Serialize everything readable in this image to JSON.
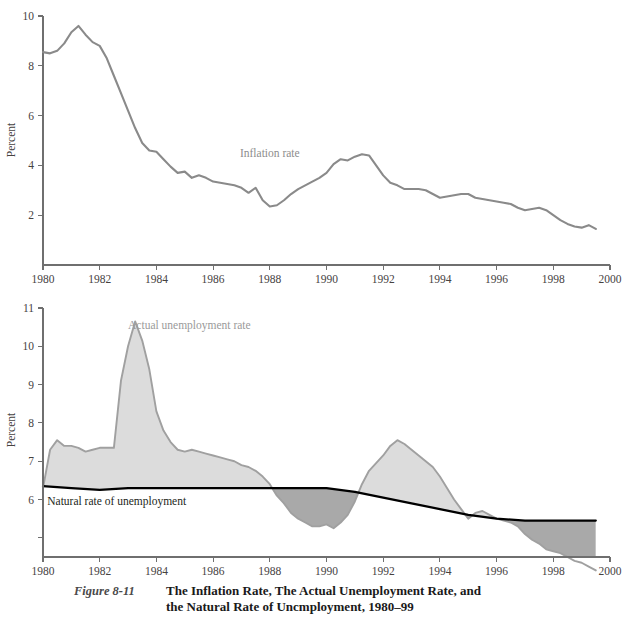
{
  "figure": {
    "number_label": "Figure 8-11",
    "title_line1": "The Inflation Rate, The Actual Unemployment Rate, and",
    "title_line2": "the Natural Rate of Uncmployment, 1980–99"
  },
  "colors": {
    "inflation_line": "#8a8a8a",
    "actual_line": "#a0a0a0",
    "natural_line": "#000000",
    "fill_above_natural": "#dcdcdc",
    "fill_below_natural": "#a9a9a9",
    "axis": "#6f6f6f",
    "tick_text": "#46423f"
  },
  "chart_data": [
    {
      "type": "line",
      "id": "inflation-chart",
      "title": "",
      "xlabel": "",
      "ylabel": "Percent",
      "xlim": [
        1980,
        2000
      ],
      "ylim": [
        0,
        10
      ],
      "xticks": [
        1980,
        1982,
        1984,
        1986,
        1988,
        1990,
        1992,
        1994,
        1996,
        1998,
        2000
      ],
      "xtick_labels": [
        "1980",
        "1982",
        "1984",
        "1986",
        "1988",
        "1990",
        "1992",
        "1994",
        "1996",
        "1998",
        "2000"
      ],
      "yticks": [
        2,
        4,
        6,
        8,
        10
      ],
      "ytick_labels": [
        "2",
        "4",
        "6",
        "8",
        "10"
      ],
      "grid": false,
      "legend_position": "inline-annotation",
      "annotations": [
        {
          "text": "Inflation rate",
          "x": 1988.0,
          "y": 4.35
        }
      ],
      "series": [
        {
          "name": "Inflation rate",
          "color": "#8a8a8a",
          "x": [
            1980.0,
            1980.25,
            1980.5,
            1980.75,
            1981.0,
            1981.25,
            1981.5,
            1981.75,
            1982.0,
            1982.25,
            1982.5,
            1982.75,
            1983.0,
            1983.25,
            1983.5,
            1983.75,
            1984.0,
            1984.25,
            1984.5,
            1984.75,
            1985.0,
            1985.25,
            1985.5,
            1985.75,
            1986.0,
            1986.25,
            1986.5,
            1986.75,
            1987.0,
            1987.25,
            1987.5,
            1987.75,
            1988.0,
            1988.25,
            1988.5,
            1988.75,
            1989.0,
            1989.25,
            1989.5,
            1989.75,
            1990.0,
            1990.25,
            1990.5,
            1990.75,
            1991.0,
            1991.25,
            1991.5,
            1991.75,
            1992.0,
            1992.25,
            1992.5,
            1992.75,
            1993.0,
            1993.25,
            1993.5,
            1993.75,
            1994.0,
            1994.25,
            1994.5,
            1994.75,
            1995.0,
            1995.25,
            1995.5,
            1995.75,
            1996.0,
            1996.25,
            1996.5,
            1996.75,
            1997.0,
            1997.25,
            1997.5,
            1997.75,
            1998.0,
            1998.25,
            1998.5,
            1998.75,
            1999.0,
            1999.25,
            1999.5
          ],
          "y": [
            8.55,
            8.5,
            8.6,
            8.9,
            9.35,
            9.6,
            9.25,
            8.95,
            8.8,
            8.3,
            7.6,
            6.9,
            6.2,
            5.5,
            4.9,
            4.6,
            4.55,
            4.25,
            3.95,
            3.7,
            3.75,
            3.5,
            3.6,
            3.5,
            3.35,
            3.3,
            3.25,
            3.2,
            3.1,
            2.9,
            3.1,
            2.6,
            2.35,
            2.4,
            2.6,
            2.85,
            3.05,
            3.2,
            3.35,
            3.5,
            3.7,
            4.05,
            4.25,
            4.2,
            4.35,
            4.45,
            4.4,
            4.0,
            3.6,
            3.3,
            3.2,
            3.05,
            3.05,
            3.05,
            3.0,
            2.85,
            2.7,
            2.75,
            2.8,
            2.85,
            2.85,
            2.7,
            2.65,
            2.6,
            2.55,
            2.5,
            2.45,
            2.3,
            2.2,
            2.25,
            2.3,
            2.2,
            2.0,
            1.8,
            1.65,
            1.55,
            1.5,
            1.6,
            1.45
          ]
        }
      ]
    },
    {
      "type": "area",
      "id": "unemployment-chart",
      "title": "",
      "xlabel": "",
      "ylabel": "Percent",
      "xlim": [
        1980,
        2000
      ],
      "ylim": [
        4.5,
        11
      ],
      "xticks": [
        1980,
        1982,
        1984,
        1986,
        1988,
        1990,
        1992,
        1994,
        1996,
        1998,
        2000
      ],
      "xtick_labels": [
        "1980",
        "1982",
        "1984",
        "1986",
        "1988",
        "1990",
        "1992",
        "1994",
        "1996",
        "1998",
        "2000"
      ],
      "yticks": [
        5,
        6,
        7,
        8,
        9,
        10,
        11
      ],
      "ytick_labels": [
        "",
        "6",
        "7",
        "8",
        "9",
        "10",
        "11"
      ],
      "grid": false,
      "legend_position": "inline-annotation",
      "annotations": [
        {
          "text": "Actual unemployment rate",
          "x": 1983.0,
          "y": 10.45
        },
        {
          "text": "Natural rate of unemployment",
          "x": 1982.6,
          "y": 5.85
        }
      ],
      "series": [
        {
          "name": "Actual unemployment rate",
          "color": "#a0a0a0",
          "x": [
            1980.0,
            1980.25,
            1980.5,
            1980.75,
            1981.0,
            1981.25,
            1981.5,
            1981.75,
            1982.0,
            1982.25,
            1982.5,
            1982.75,
            1983.0,
            1983.25,
            1983.5,
            1983.75,
            1984.0,
            1984.25,
            1984.5,
            1984.75,
            1985.0,
            1985.25,
            1985.5,
            1985.75,
            1986.0,
            1986.25,
            1986.5,
            1986.75,
            1987.0,
            1987.25,
            1987.5,
            1987.75,
            1988.0,
            1988.25,
            1988.5,
            1988.75,
            1989.0,
            1989.25,
            1989.5,
            1989.75,
            1990.0,
            1990.25,
            1990.5,
            1990.75,
            1991.0,
            1991.25,
            1991.5,
            1991.75,
            1992.0,
            1992.25,
            1992.5,
            1992.75,
            1993.0,
            1993.25,
            1993.5,
            1993.75,
            1994.0,
            1994.25,
            1994.5,
            1994.75,
            1995.0,
            1995.25,
            1995.5,
            1995.75,
            1996.0,
            1996.25,
            1996.5,
            1996.75,
            1997.0,
            1997.25,
            1997.5,
            1997.75,
            1998.0,
            1998.25,
            1998.5,
            1998.75,
            1999.0,
            1999.25,
            1999.5
          ],
          "y": [
            6.3,
            7.3,
            7.55,
            7.4,
            7.4,
            7.35,
            7.25,
            7.3,
            7.35,
            7.35,
            7.35,
            9.1,
            10.0,
            10.65,
            10.15,
            9.4,
            8.3,
            7.8,
            7.5,
            7.3,
            7.25,
            7.3,
            7.25,
            7.2,
            7.15,
            7.1,
            7.05,
            7.0,
            6.9,
            6.85,
            6.75,
            6.6,
            6.4,
            6.1,
            5.9,
            5.65,
            5.5,
            5.4,
            5.3,
            5.3,
            5.35,
            5.25,
            5.4,
            5.6,
            5.95,
            6.4,
            6.75,
            6.95,
            7.15,
            7.4,
            7.55,
            7.45,
            7.3,
            7.15,
            7.0,
            6.85,
            6.6,
            6.3,
            6.0,
            5.75,
            5.5,
            5.65,
            5.7,
            5.6,
            5.5,
            5.45,
            5.4,
            5.3,
            5.1,
            4.95,
            4.85,
            4.7,
            4.65,
            4.6,
            4.5,
            4.4,
            4.35,
            4.25,
            4.15
          ]
        },
        {
          "name": "Natural rate of unemployment",
          "color": "#000000",
          "x": [
            1980.0,
            1981.0,
            1982.0,
            1983.0,
            1984.0,
            1985.0,
            1986.0,
            1987.0,
            1988.0,
            1989.0,
            1990.0,
            1991.0,
            1992.0,
            1993.0,
            1994.0,
            1995.0,
            1996.0,
            1997.0,
            1998.0,
            1999.0,
            1999.5
          ],
          "y": [
            6.35,
            6.3,
            6.25,
            6.3,
            6.3,
            6.3,
            6.3,
            6.3,
            6.3,
            6.3,
            6.3,
            6.2,
            6.05,
            5.9,
            5.75,
            5.6,
            5.5,
            5.45,
            5.45,
            5.45,
            5.45
          ]
        }
      ]
    }
  ]
}
